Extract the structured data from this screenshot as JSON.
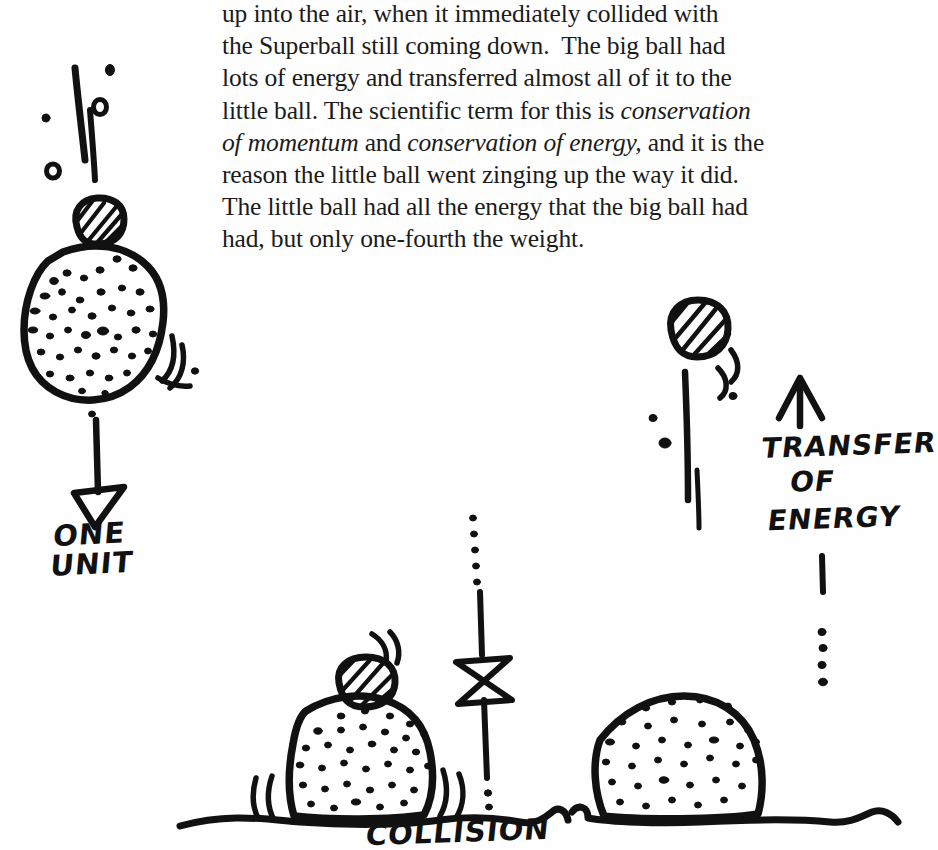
{
  "page": {
    "kind": "scanned-book-page",
    "background_color": "#fefefe",
    "ink_color": "#111111",
    "text_color": "#1b1b1b",
    "width": 924,
    "height": 843
  },
  "body_text": {
    "partial_top_line": "p",
    "lines": [
      "up into the air, when it immediately collided with",
      "the Superball still coming down.  The big ball had",
      "lots of energy and transferred almost all of it to the",
      "little ball.  The scientific term for this  is conservation",
      "of momentum and conservation of energy, and it is the",
      "reason the little ball went zinging up the way it did.",
      "The little ball had all the energy that the big ball had",
      "had, but only one-fourth the weight."
    ],
    "line4": {
      "plain_a": "little ball.  The scientific term for this  is ",
      "italic_a": "conservation"
    },
    "line5": {
      "italic_a": "of momentum",
      "plain_a": " and ",
      "italic_b": "conservation of energy,",
      "plain_b": " and it is the"
    },
    "full_paragraph": "up into the air, when it immediately collided with the Superball still coming down. The big ball had lots of energy and transferred almost all of it to the little ball. The scientific term for this is conservation of momentum and conservation of energy, and it is the reason the little ball went zinging up the way it did. The little ball had all the energy that the big ball had had, but only one-fourth the weight.",
    "italic_terms": [
      "conservation of momentum",
      "conservation of energy"
    ]
  },
  "annotations": {
    "one_unit": "ONE\nUNIT",
    "one_unit_line1": "ONE",
    "one_unit_line2": "UNIT",
    "transfer": "TRANSFER",
    "of": "OF",
    "energy": "ENERGY",
    "collision": "COLLISION"
  },
  "figures": [
    {
      "id": "figure-falling-stack",
      "caption_label": "ONE UNIT",
      "description": "Big speckled ball with small striped Superball balanced on top, falling, with motion streaks and a downward arrow labeled ONE UNIT",
      "elements": [
        "motion-streaks",
        "striped-superball",
        "speckled-big-ball",
        "impact-swooshes",
        "down-arrow",
        "one-unit-label"
      ]
    },
    {
      "id": "figure-rebound",
      "caption_label": "TRANSFER OF ENERGY",
      "description": "Small striped Superball zinging upward with motion streaks, beside an up-arrow labeled TRANSFER OF ENERGY and a dotted trajectory",
      "elements": [
        "striped-superball",
        "motion-streaks",
        "up-arrow",
        "transfer-of-energy-label",
        "dotted-trail"
      ]
    },
    {
      "id": "figure-collision",
      "caption_label": "COLLISION",
      "description": "Big speckled ball resting on the ground with the striped Superball on top at the moment of impact, impact swooshes, and a bowtie trajectory marker on a dotted line",
      "elements": [
        "speckled-big-ball",
        "striped-superball",
        "ground-line",
        "impact-swooshes",
        "bowtie-marker",
        "dotted-trajectory"
      ]
    },
    {
      "id": "figure-ball-at-rest",
      "description": "Big speckled ball at rest on the ground after transferring its energy",
      "elements": [
        "speckled-big-ball",
        "ground-line"
      ]
    }
  ]
}
